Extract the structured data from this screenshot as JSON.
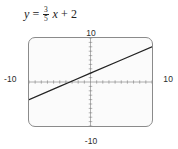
{
  "equation": {
    "lhs": "y",
    "equals": "=",
    "slope_numerator": "3",
    "slope_denominator": "5",
    "variable": "x",
    "plus": "+",
    "intercept": "2",
    "full_text": "y = 3/5 x + 2"
  },
  "window": {
    "xmin_label": "-10",
    "xmax_label": "10",
    "ymin_label": "-10",
    "ymax_label": "10"
  },
  "colors": {
    "line": "#222222",
    "axis": "#6e6e6e",
    "border": "#8b8b8b",
    "screen_background": "#fbfbfb",
    "text": "#222222"
  },
  "chart_data": {
    "type": "line",
    "xlabel": "",
    "ylabel": "",
    "xlim": [
      -10,
      10
    ],
    "ylim": [
      -10,
      10
    ],
    "grid": false,
    "axes_shown": true,
    "tick_interval": 1,
    "equation": {
      "slope": 0.6,
      "y_intercept": 2,
      "x_intercept": -3.3333
    },
    "series": [
      {
        "name": "y = 3/5 x + 2",
        "x": [
          -10,
          -5,
          -3.3333,
          0,
          5,
          10
        ],
        "y": [
          -4,
          -1,
          0,
          2,
          5,
          8
        ]
      }
    ]
  }
}
